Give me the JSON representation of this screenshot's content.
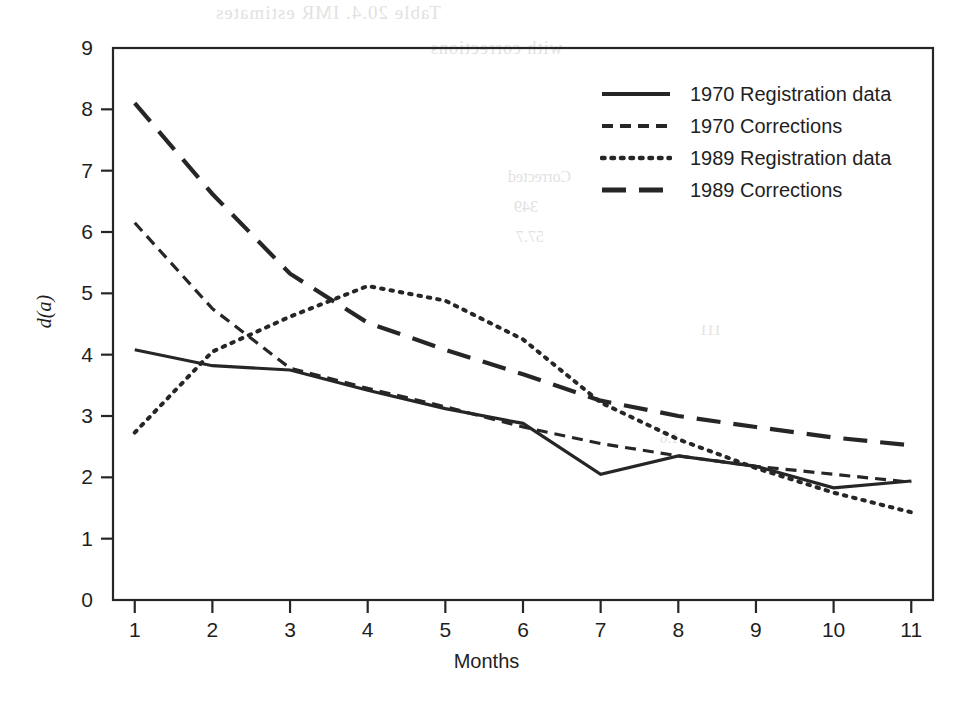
{
  "figure": {
    "width": 973,
    "height": 705,
    "background": "#ffffff",
    "ink_color": "#262626"
  },
  "axis_label_y": "d(a)",
  "axis_label_x": "Months",
  "bleed_through": {
    "title": "Table 20.4.  IMR estimates",
    "subtitle": "with corrections",
    "col": "Corrected",
    "n1": "349",
    "n2": "57.7",
    "n3": "111",
    "n4": "1.6"
  },
  "legend": {
    "entries": [
      {
        "label": "1970 Registration data",
        "style": "solid",
        "key_name": "legend-key-solid"
      },
      {
        "label": "1970 Corrections",
        "style": "dashed",
        "key_name": "legend-key-dashed"
      },
      {
        "label": "1989 Registration data",
        "style": "dotted",
        "key_name": "legend-key-dotted"
      },
      {
        "label": "1989 Corrections",
        "style": "longdashed",
        "key_name": "legend-key-longdashed"
      }
    ]
  },
  "chart_data": {
    "type": "line",
    "title": "",
    "xlabel": "Months",
    "ylabel": "d(a)",
    "xlim": [
      0.72,
      11.28
    ],
    "ylim": [
      0,
      9
    ],
    "xticks": [
      1,
      2,
      3,
      4,
      5,
      6,
      7,
      8,
      9,
      10,
      11
    ],
    "yticks": [
      0,
      1,
      2,
      3,
      4,
      5,
      6,
      7,
      8,
      9
    ],
    "xtick_labels": [
      "1",
      "2",
      "3",
      "4",
      "5",
      "6",
      "7",
      "8",
      "9",
      "10",
      "11"
    ],
    "ytick_labels": [
      "0",
      "1",
      "2",
      "3",
      "4",
      "5",
      "6",
      "7",
      "8",
      "9"
    ],
    "grid": false,
    "legend_position": "top-right",
    "x": [
      1,
      2,
      3,
      4,
      5,
      6,
      7,
      8,
      9,
      10,
      11
    ],
    "series": [
      {
        "name": "1970 Registration data",
        "style": "solid",
        "dash": "none",
        "width": 3.2,
        "color": "#262626",
        "values": [
          4.08,
          3.82,
          3.75,
          3.42,
          3.12,
          2.88,
          2.05,
          2.35,
          2.18,
          1.83,
          1.94
        ]
      },
      {
        "name": "1970 Corrections",
        "style": "dashed",
        "dash": "11,7",
        "width": 3.2,
        "color": "#262626",
        "values": [
          6.15,
          4.75,
          3.78,
          3.45,
          3.15,
          2.82,
          2.55,
          2.35,
          2.18,
          2.05,
          1.92
        ]
      },
      {
        "name": "1989 Registration data",
        "style": "dotted",
        "dash": "2.5,7",
        "width": 4.0,
        "color": "#262626",
        "values": [
          2.73,
          4.05,
          4.62,
          5.12,
          4.88,
          4.25,
          3.22,
          2.62,
          2.15,
          1.75,
          1.43
        ]
      },
      {
        "name": "1989 Corrections",
        "style": "longdashed",
        "dash": "24,13",
        "width": 4.2,
        "color": "#262626",
        "values": [
          8.1,
          6.62,
          5.32,
          4.52,
          4.08,
          3.68,
          3.25,
          3.0,
          2.82,
          2.65,
          2.52
        ]
      }
    ]
  }
}
